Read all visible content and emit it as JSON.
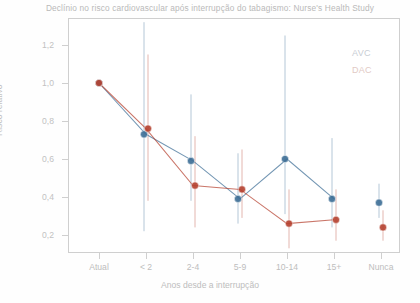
{
  "chart_data": {
    "type": "line",
    "title": "Declínio no risco cardiovascular após interrupção do tabagismo: Nurse's Health Study",
    "xlabel": "Anos desde a interrupção",
    "ylabel": "Risco relativo",
    "categories": [
      "Atual",
      "< 2",
      "2-4",
      "5-9",
      "10-14",
      "15+",
      "Nunca"
    ],
    "yticks": [
      "0,2",
      "0,4",
      "0,6",
      "0,8",
      "1,0",
      "1,2"
    ],
    "ytick_values": [
      0.2,
      0.4,
      0.6,
      0.8,
      1.0,
      1.2
    ],
    "ylim": [
      0.1,
      1.32
    ],
    "grid": false,
    "legend_position": "top-right",
    "series": [
      {
        "name": "AVC",
        "color": "#3d6e96",
        "values": [
          1.0,
          0.73,
          0.59,
          0.39,
          0.6,
          0.39,
          0.37
        ],
        "err_low": [
          1.0,
          0.22,
          0.38,
          0.26,
          0.31,
          0.24,
          0.29
        ],
        "err_high": [
          1.0,
          1.32,
          0.94,
          0.63,
          1.25,
          0.71,
          0.47
        ]
      },
      {
        "name": "DAC",
        "color": "#b5412f",
        "values": [
          1.0,
          0.76,
          0.46,
          0.44,
          0.26,
          0.28,
          0.24
        ],
        "err_low": [
          1.0,
          0.38,
          0.24,
          0.29,
          0.13,
          0.17,
          0.17
        ],
        "err_high": [
          1.0,
          1.15,
          0.72,
          0.65,
          0.44,
          0.44,
          0.33
        ]
      }
    ],
    "connect_last_point": false
  },
  "legend": {
    "avc_label": "AVC",
    "dac_label": "DAC"
  }
}
